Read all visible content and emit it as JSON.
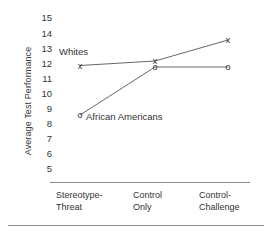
{
  "chart_data": {
    "type": "line",
    "title": "",
    "xlabel": "",
    "ylabel": "Average Test Performance",
    "ylim": [
      5,
      15
    ],
    "yticks": [
      15,
      14,
      13,
      12,
      11,
      10,
      9,
      8,
      7,
      6,
      5
    ],
    "grid": false,
    "legend_position": "inline-annotation",
    "categories": [
      "Stereotype-Threat",
      "Control Only",
      "Control-Challenge"
    ],
    "category_lines": [
      [
        "Stereotype-",
        "Threat"
      ],
      [
        "Control",
        "Only"
      ],
      [
        "Control-",
        "Challenge"
      ]
    ],
    "series": [
      {
        "name": "Whites",
        "marker": "x",
        "values": [
          11.8,
          12.1,
          13.5
        ]
      },
      {
        "name": "African Americans",
        "marker": "o",
        "values": [
          8.5,
          11.7,
          11.7
        ]
      }
    ],
    "annotations": [
      {
        "text": "Whites",
        "series": "Whites"
      },
      {
        "text": "African Americans",
        "series": "African Americans"
      }
    ],
    "colors": {
      "line": "#555555",
      "marker": "#2b2b2b",
      "axis": "#8a8a8a",
      "text": "#333333",
      "background": "#ffffff"
    }
  }
}
